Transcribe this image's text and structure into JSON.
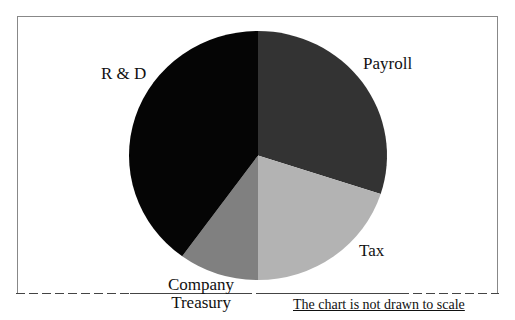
{
  "chart_data": {
    "type": "pie",
    "title": "",
    "note": "The chart is not drawn to scale",
    "start_angle_deg": 0,
    "direction": "clockwise",
    "slices": [
      {
        "label": "Payroll",
        "value": 30,
        "color": "#333333"
      },
      {
        "label": "Tax",
        "value": 20,
        "color": "#b3b3b3"
      },
      {
        "label": "Company Treasury",
        "value": 10,
        "color": "#808080"
      },
      {
        "label": "R & D",
        "value": 40,
        "color": "#050505"
      }
    ],
    "categories": [
      "Payroll",
      "Tax",
      "Company Treasury",
      "R & D"
    ],
    "values": [
      30,
      20,
      10,
      40
    ],
    "legend": "none (direct labels)",
    "units": "approximate share (%) estimated from slice angles"
  },
  "labels": {
    "payroll": "Payroll",
    "tax": "Tax",
    "treasury_line1": "Company",
    "treasury_line2": "Treasury",
    "rd": "R & D"
  },
  "footer": {
    "note": "The chart is not drawn to scale"
  }
}
